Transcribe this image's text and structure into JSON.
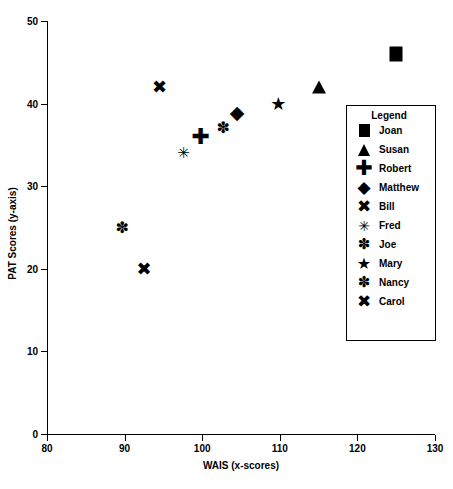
{
  "chart_data": {
    "type": "scatter",
    "title": "",
    "xlabel": "WAIS (x-scores)",
    "ylabel": "PAT Scores (y-axis)",
    "xlim": [
      80,
      130
    ],
    "ylim": [
      0,
      50
    ],
    "xticks": [
      80,
      90,
      100,
      110,
      120,
      130
    ],
    "yticks": [
      0,
      10,
      20,
      30,
      40,
      50
    ],
    "grid": false,
    "legend_position": "right-inside",
    "legend_title": "Legend",
    "series": [
      {
        "name": "Joan",
        "marker": "square",
        "x": 125.0,
        "y": 46
      },
      {
        "name": "Susan",
        "marker": "triangle",
        "x": 115.0,
        "y": 42
      },
      {
        "name": "Robert",
        "marker": "plus",
        "x": 99.8,
        "y": 36
      },
      {
        "name": "Matthew",
        "marker": "diamond",
        "x": 104.5,
        "y": 39
      },
      {
        "name": "Bill",
        "marker": "x",
        "x": 94.5,
        "y": 42
      },
      {
        "name": "Fred",
        "marker": "thinstar",
        "x": 97.6,
        "y": 34
      },
      {
        "name": "Joe",
        "marker": "burst",
        "x": 89.7,
        "y": 25
      },
      {
        "name": "Mary",
        "marker": "star",
        "x": 109.8,
        "y": 40
      },
      {
        "name": "Nancy",
        "marker": "burst",
        "x": 102.7,
        "y": 37
      },
      {
        "name": "Carol",
        "marker": "x",
        "x": 92.5,
        "y": 20
      }
    ]
  },
  "glyphs": {
    "plus": "✚",
    "diamond": "◆",
    "x": "✖",
    "star": "★",
    "burst": "✽",
    "thinstar": "✳"
  },
  "colors": {
    "axis": "#000000",
    "marker": "#000000",
    "background": "#ffffff"
  }
}
